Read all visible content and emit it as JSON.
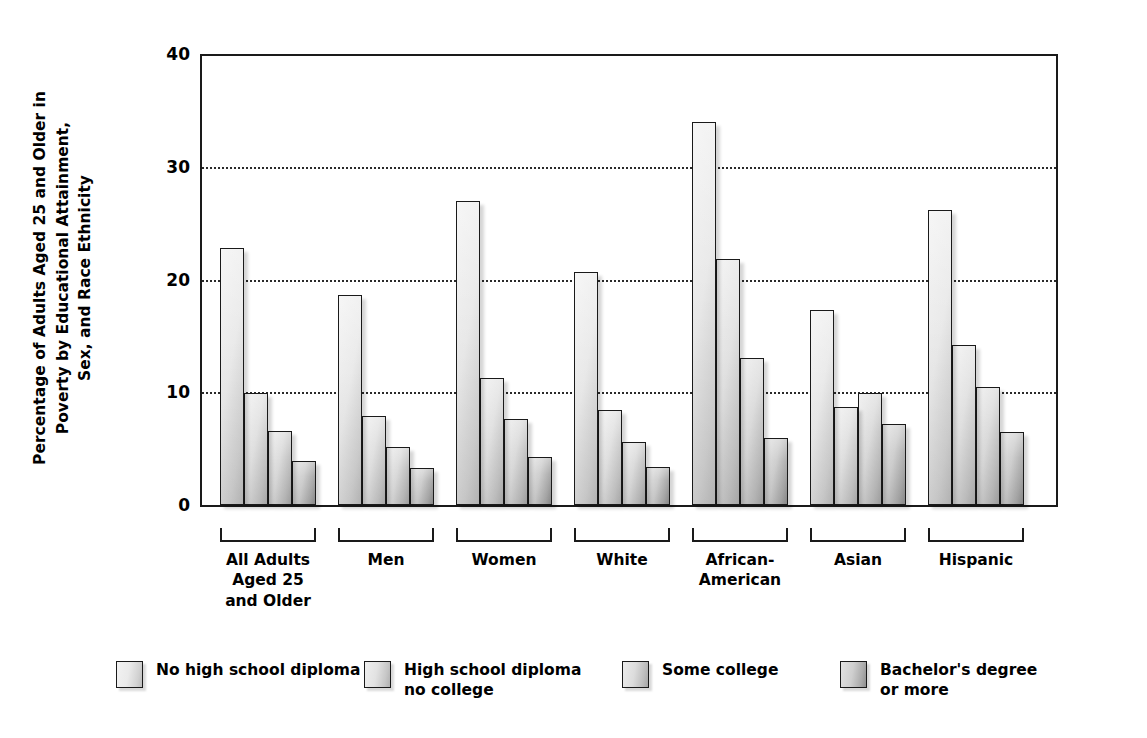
{
  "chart_data": {
    "type": "bar",
    "title": "",
    "xlabel": "",
    "ylabel": "Percentage of Adults Aged 25 and Older in\nPoverty by Educational Attainment,\nSex, and Race Ethnicity",
    "ylabel_lines": [
      "Percentage of Adults Aged 25 and Older in",
      "Poverty by Educational Attainment,",
      "Sex, and Race Ethnicity"
    ],
    "ylim": [
      0,
      40
    ],
    "yticks": [
      0,
      10,
      20,
      30,
      40
    ],
    "ytick_labels": [
      "0",
      "10",
      "20",
      "30",
      "40"
    ],
    "grid": "horizontal-dotted",
    "legend_position": "bottom",
    "categories": [
      "All Adults\nAged 25\nand Older",
      "Men",
      "Women",
      "White",
      "African-\nAmerican",
      "Asian",
      "Hispanic"
    ],
    "category_lines": [
      [
        "All Adults",
        "Aged 25",
        "and Older"
      ],
      [
        "Men"
      ],
      [
        "Women"
      ],
      [
        "White"
      ],
      [
        "African-",
        "American"
      ],
      [
        "Asian"
      ],
      [
        "Hispanic"
      ]
    ],
    "series": [
      {
        "name": "No high school diploma",
        "values": [
          22.8,
          18.6,
          27.0,
          20.7,
          34.0,
          17.3,
          26.2
        ]
      },
      {
        "name": "High school diploma\nno college",
        "values": [
          9.9,
          7.9,
          11.3,
          8.4,
          21.8,
          8.7,
          14.2
        ]
      },
      {
        "name": "Some college",
        "values": [
          6.6,
          5.1,
          7.6,
          5.6,
          13.0,
          9.9,
          10.5
        ]
      },
      {
        "name": "Bachelor's degree\nor more",
        "values": [
          3.9,
          3.3,
          4.3,
          3.4,
          5.9,
          7.2,
          6.5
        ]
      }
    ]
  },
  "legend": {
    "items": [
      {
        "label": "No high school diploma"
      },
      {
        "label": "High school diploma\nno college"
      },
      {
        "label": "Some college"
      },
      {
        "label": "Bachelor's degree\nor more"
      }
    ]
  }
}
